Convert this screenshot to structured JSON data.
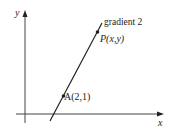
{
  "diagram": {
    "axes": {
      "x_label": "x",
      "y_label": "y"
    },
    "line": {
      "annotation": "gradient 2"
    },
    "points": [
      {
        "label": "P(x,y)"
      },
      {
        "label": "A(2,1)"
      }
    ]
  }
}
